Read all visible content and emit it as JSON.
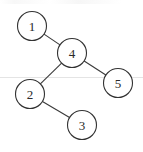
{
  "diagram": {
    "type": "tree",
    "nodes": [
      {
        "id": "1",
        "label": "1",
        "cx": 32,
        "cy": 26
      },
      {
        "id": "4",
        "label": "4",
        "cx": 72,
        "cy": 53
      },
      {
        "id": "5",
        "label": "5",
        "cx": 118,
        "cy": 83
      },
      {
        "id": "2",
        "label": "2",
        "cx": 30,
        "cy": 94
      },
      {
        "id": "3",
        "label": "3",
        "cx": 82,
        "cy": 125
      }
    ],
    "edges": [
      {
        "from": "1",
        "to": "4"
      },
      {
        "from": "4",
        "to": "2"
      },
      {
        "from": "4",
        "to": "5"
      },
      {
        "from": "2",
        "to": "3"
      }
    ],
    "node_radius": 14.5,
    "colors": {
      "background": "#ffffff",
      "stroke": "#333333",
      "text": "#2a2a2a"
    }
  }
}
